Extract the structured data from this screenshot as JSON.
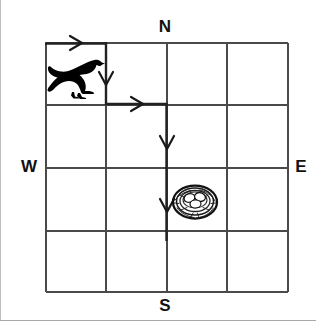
{
  "diagram": {
    "type": "grid-path-map",
    "grid": {
      "columns": 4,
      "rows": 4,
      "line_color": "#3a3a3a",
      "background_color": "#ffffff"
    },
    "compass": {
      "north_label": "N",
      "south_label": "S",
      "west_label": "W",
      "east_label": "E"
    },
    "icons": {
      "bird": {
        "name": "bird-icon",
        "description": "black crow silhouette",
        "cell_column": 1,
        "cell_row": 1,
        "color": "#000000"
      },
      "nest": {
        "name": "nest-icon",
        "description": "nest with eggs",
        "cell_column": 3,
        "cell_row": 3,
        "color": "#1a1a1a"
      }
    },
    "path": {
      "color": "#2b2b2b",
      "segments": [
        {
          "name": "segment-east-1",
          "direction": "east",
          "from_x": 46,
          "from_y": 43,
          "to_x": 106,
          "to_y": 43
        },
        {
          "name": "segment-south-1",
          "direction": "south",
          "from_x": 106,
          "from_y": 43,
          "to_x": 106,
          "to_y": 104
        },
        {
          "name": "segment-east-2",
          "direction": "east",
          "from_x": 106,
          "from_y": 104,
          "to_x": 167,
          "to_y": 104
        },
        {
          "name": "segment-south-2",
          "direction": "south",
          "from_x": 167,
          "from_y": 104,
          "to_x": 167,
          "to_y": 240
        }
      ],
      "arrows": [
        {
          "name": "arrow-east-1",
          "direction": "east",
          "x": 76,
          "y": 43
        },
        {
          "name": "arrow-south-1",
          "direction": "south",
          "x": 106,
          "y": 78
        },
        {
          "name": "arrow-east-2",
          "direction": "east",
          "x": 137,
          "y": 104
        },
        {
          "name": "arrow-south-2",
          "direction": "south",
          "x": 167,
          "y": 142
        },
        {
          "name": "arrow-south-3",
          "direction": "south",
          "x": 167,
          "y": 205
        }
      ]
    }
  }
}
